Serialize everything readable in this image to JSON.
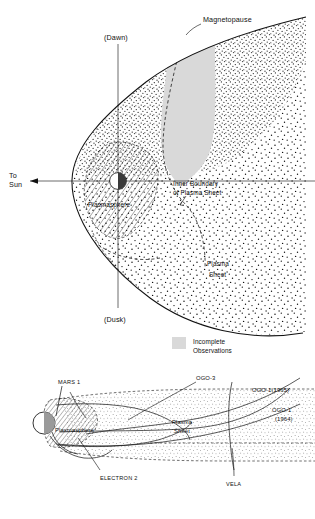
{
  "figure": {
    "domain": "scientific-diagram"
  },
  "top_panel": {
    "labels": {
      "magnetopause": "Magnetopause",
      "dawn": "(Dawn)",
      "dusk": "(Dusk)",
      "to_sun_line1": "To",
      "to_sun_line2": "Sun",
      "plasmasphere": "Plasmasphere",
      "inner_boundary_line1": "Inner Boundary",
      "inner_boundary_line2": "of Plasma Sheet",
      "plasma_sheet_line1": "Plasma",
      "plasma_sheet_line2": "Sheet"
    },
    "legend": {
      "swatch_color": "#d9d9d9",
      "line1": "Incomplete",
      "line2": "Observations"
    }
  },
  "bottom_panel": {
    "labels": {
      "mars_1": "MARS 1",
      "ogo_3": "OGO-3",
      "ogo_1_1965": "OGO-1(1965)",
      "ogo_1_1964_line1": "OGO-1",
      "ogo_1_1964_line2": "(1964)",
      "electron_2": "ELECTRON 2",
      "vela": "VELA",
      "plasmasphere": "Plasmasphere",
      "plasma_sheet_line1": "Plasma",
      "plasma_sheet_line2": "Sheet"
    }
  },
  "colors": {
    "ink": "#111111",
    "incomplete_gray": "#d9d9d9",
    "plasma_sheet_fill": "#ededed",
    "earth_shadow": "#9a9a9a",
    "earth_dark": "#3a3a3a"
  }
}
